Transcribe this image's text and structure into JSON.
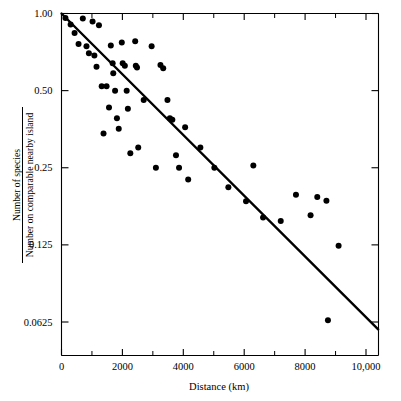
{
  "chart_data": {
    "type": "scatter",
    "title": "",
    "xlabel": "Distance (km)",
    "ylabel_numerator": "Number of species",
    "ylabel_denominator": "Number on comparable nearby island",
    "xlim": [
      0,
      10400
    ],
    "ylim": [
      0.0545,
      1.0
    ],
    "yscale": "log",
    "grid": false,
    "legend": null,
    "xticks": [
      0,
      2000,
      4000,
      6000,
      8000,
      10000
    ],
    "xticklabels": [
      "0",
      "2000",
      "4000",
      "6000",
      "8000",
      "10,000"
    ],
    "xminorticks": [
      1000,
      3000,
      5000,
      7000,
      9000
    ],
    "yticks": [
      1.0,
      0.5,
      0.25,
      0.125,
      0.0625
    ],
    "yticklabels": [
      "1.00",
      "0.50",
      "0.25",
      "0.125",
      "0.0625"
    ],
    "point_color": "#000000",
    "line_color": "#000000",
    "points": [
      {
        "x": 130,
        "y": 0.96
      },
      {
        "x": 300,
        "y": 0.905
      },
      {
        "x": 430,
        "y": 0.84
      },
      {
        "x": 560,
        "y": 0.76
      },
      {
        "x": 700,
        "y": 0.955
      },
      {
        "x": 820,
        "y": 0.745
      },
      {
        "x": 900,
        "y": 0.7
      },
      {
        "x": 1020,
        "y": 0.93
      },
      {
        "x": 1080,
        "y": 0.685
      },
      {
        "x": 1150,
        "y": 0.62
      },
      {
        "x": 1230,
        "y": 0.9
      },
      {
        "x": 1320,
        "y": 0.52
      },
      {
        "x": 1380,
        "y": 0.34
      },
      {
        "x": 1480,
        "y": 0.52
      },
      {
        "x": 1560,
        "y": 0.43
      },
      {
        "x": 1620,
        "y": 0.75
      },
      {
        "x": 1680,
        "y": 0.64
      },
      {
        "x": 1700,
        "y": 0.585
      },
      {
        "x": 1760,
        "y": 0.5
      },
      {
        "x": 1820,
        "y": 0.39
      },
      {
        "x": 1880,
        "y": 0.355
      },
      {
        "x": 1980,
        "y": 0.77
      },
      {
        "x": 2010,
        "y": 0.64
      },
      {
        "x": 2080,
        "y": 0.625
      },
      {
        "x": 2140,
        "y": 0.5
      },
      {
        "x": 2180,
        "y": 0.425
      },
      {
        "x": 2260,
        "y": 0.285
      },
      {
        "x": 2420,
        "y": 0.78
      },
      {
        "x": 2440,
        "y": 0.625
      },
      {
        "x": 2480,
        "y": 0.615
      },
      {
        "x": 2520,
        "y": 0.3
      },
      {
        "x": 2700,
        "y": 0.46
      },
      {
        "x": 2960,
        "y": 0.745
      },
      {
        "x": 3100,
        "y": 0.25
      },
      {
        "x": 3250,
        "y": 0.63
      },
      {
        "x": 3340,
        "y": 0.612
      },
      {
        "x": 3480,
        "y": 0.46
      },
      {
        "x": 3560,
        "y": 0.39
      },
      {
        "x": 3640,
        "y": 0.385
      },
      {
        "x": 3760,
        "y": 0.28
      },
      {
        "x": 3860,
        "y": 0.25
      },
      {
        "x": 4060,
        "y": 0.36
      },
      {
        "x": 4160,
        "y": 0.225
      },
      {
        "x": 4560,
        "y": 0.3
      },
      {
        "x": 5020,
        "y": 0.25
      },
      {
        "x": 5480,
        "y": 0.21
      },
      {
        "x": 6060,
        "y": 0.185
      },
      {
        "x": 6300,
        "y": 0.255
      },
      {
        "x": 6620,
        "y": 0.16
      },
      {
        "x": 7200,
        "y": 0.155
      },
      {
        "x": 7700,
        "y": 0.196
      },
      {
        "x": 8180,
        "y": 0.163
      },
      {
        "x": 8400,
        "y": 0.192
      },
      {
        "x": 8700,
        "y": 0.186
      },
      {
        "x": 8750,
        "y": 0.0635
      },
      {
        "x": 9100,
        "y": 0.124
      }
    ],
    "trend_line": {
      "x_start": 0,
      "y_start": 1.0,
      "x_end": 10400,
      "y_end": 0.0585
    }
  }
}
